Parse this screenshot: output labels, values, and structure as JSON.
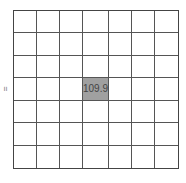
{
  "chart_data": {
    "type": "heatmap",
    "title": "",
    "xlabel": "",
    "ylabel": "=",
    "rows": 7,
    "cols": 7,
    "grid": true,
    "cells": [
      {
        "row": 3,
        "col": 3,
        "value": 109.9,
        "label": "109.9",
        "color": "#a0a0a0"
      }
    ]
  },
  "colors": {
    "highlight": "#a0a0a0",
    "grid_line": "#555555",
    "background": "#ffffff"
  }
}
